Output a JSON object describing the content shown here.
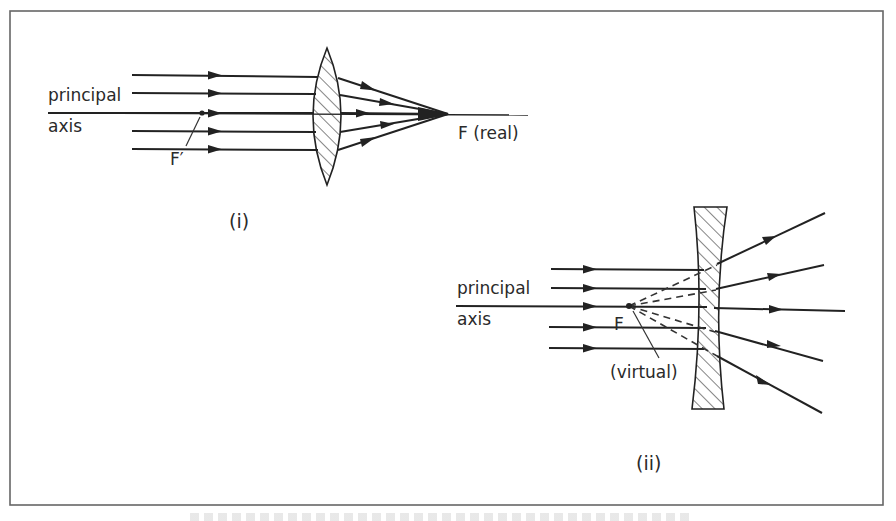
{
  "figure": {
    "frame": {
      "x": 10,
      "y": 11,
      "width": 873,
      "height": 494,
      "stroke": "#666666"
    },
    "panels": [
      {
        "id": "i",
        "label": "(i)",
        "lens_type": "converging (convex)",
        "axis_label_line1": "principal",
        "axis_label_line2": "axis",
        "focus_label": "F (real)",
        "secondary_focus_label": "F′",
        "incoming_ray_count": 5,
        "ray_y": [
          75,
          93,
          113,
          131,
          149
        ],
        "focus_point": {
          "x": 448,
          "y": 114
        }
      },
      {
        "id": "ii",
        "label": "(ii)",
        "lens_type": "diverging (concave)",
        "axis_label_line1": "principal",
        "axis_label_line2": "axis",
        "focus_label": "F",
        "focus_note": "(virtual)",
        "incoming_ray_count": 5,
        "ray_y": [
          269,
          288,
          306,
          327,
          348
        ],
        "focus_point": {
          "x": 629,
          "y": 306
        }
      }
    ],
    "caption": {
      "visible": "clipped",
      "text": ""
    },
    "colors": {
      "ink": "#222222",
      "background": "#ffffff"
    }
  }
}
